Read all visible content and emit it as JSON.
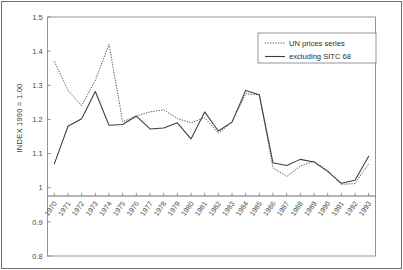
{
  "chart_data": {
    "type": "line",
    "title": "",
    "xlabel": "",
    "ylabel": "INDEX 1990 = 1.00",
    "ylim": [
      0.8,
      1.5
    ],
    "yticks": [
      "1.5",
      "1.4",
      "1.3",
      "1.2",
      "1.1",
      "1",
      "0.9",
      "0.8"
    ],
    "ytick_values": [
      1.5,
      1.4,
      1.3,
      1.2,
      1.1,
      1.0,
      0.9,
      0.8
    ],
    "grid": false,
    "legend_position": "top-right",
    "categories": [
      "1970",
      "1971",
      "1972",
      "1973",
      "1974",
      "1975",
      "1976",
      "1977",
      "1978",
      "1979",
      "1980",
      "1981",
      "1982",
      "1983",
      "1984",
      "1985",
      "1986",
      "1987",
      "1988",
      "1989",
      "1990",
      "1991",
      "1992",
      "1993"
    ],
    "series": [
      {
        "name": "UN prices series",
        "style": "dotted",
        "color": "#555555",
        "values": [
          1.37,
          1.285,
          1.24,
          1.315,
          1.42,
          1.193,
          1.21,
          1.222,
          1.228,
          1.203,
          1.19,
          1.205,
          1.16,
          1.192,
          1.275,
          1.272,
          1.058,
          1.033,
          1.063,
          1.078,
          1.05,
          1.01,
          1.012,
          1.07
        ]
      },
      {
        "name": "excluding SITC 68",
        "style": "solid",
        "color": "#3c3c3c",
        "values": [
          1.07,
          1.18,
          1.202,
          1.282,
          1.183,
          1.185,
          1.21,
          1.172,
          1.175,
          1.19,
          1.143,
          1.222,
          1.166,
          1.192,
          1.285,
          1.272,
          1.073,
          1.065,
          1.083,
          1.075,
          1.048,
          1.013,
          1.022,
          1.092
        ]
      }
    ]
  },
  "legend": {
    "entries": [
      {
        "label": "UN prices series"
      },
      {
        "label": "excluding SITC 68"
      }
    ]
  }
}
